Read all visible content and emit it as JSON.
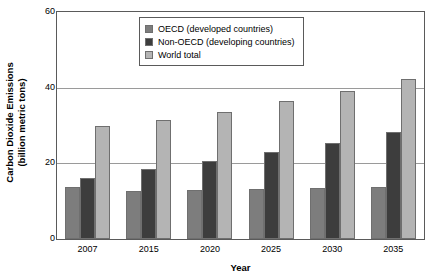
{
  "chart_data": {
    "type": "bar",
    "title": "",
    "xlabel": "Year",
    "ylabel": "Carbon Dioxide Emissions (billion metric tons)",
    "ylabel_line1": "Carbon Dioxide Emissions",
    "ylabel_line2": "(billion metric tons)",
    "categories": [
      "2007",
      "2015",
      "2020",
      "2025",
      "2030",
      "2035"
    ],
    "ylim": [
      0,
      60
    ],
    "yticks": [
      "0",
      "20",
      "40",
      "60"
    ],
    "ytick_values": [
      0,
      20,
      40,
      60
    ],
    "grid": true,
    "legend_position": "top-center",
    "series": [
      {
        "name": "OECD (developed countries)",
        "color": "#7d7d7d",
        "values": [
          13.8,
          12.8,
          13.0,
          13.3,
          13.5,
          13.8
        ]
      },
      {
        "name": "Non-OECD (developing countries)",
        "color": "#3d3d3d",
        "values": [
          16.0,
          18.5,
          20.6,
          23.0,
          25.5,
          28.2
        ]
      },
      {
        "name": "World total",
        "color": "#b4b4b4",
        "values": [
          29.8,
          31.5,
          33.7,
          36.4,
          39.2,
          42.2
        ]
      }
    ]
  },
  "legend": {
    "items": [
      {
        "label": "OECD (developed countries)",
        "swatch": "oecd"
      },
      {
        "label": "Non-OECD (developing countries)",
        "swatch": "nonoecd"
      },
      {
        "label": "World total",
        "swatch": "world"
      }
    ]
  }
}
